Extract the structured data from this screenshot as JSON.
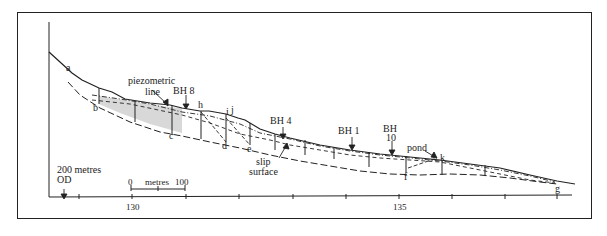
{
  "figure": {
    "type": "geological cross-section of landslide slope",
    "point_labels": [
      "a",
      "b",
      "c",
      "d",
      "e",
      "f",
      "g",
      "h",
      "i",
      "j",
      "k"
    ],
    "annotations": {
      "piezometric": [
        "piezometric",
        "line"
      ],
      "bh8": "BH 8",
      "bh4": "BH 4",
      "bh1": "BH 1",
      "bh10": [
        "BH",
        "10"
      ],
      "pond": "pond",
      "slip": [
        "slip",
        "surface"
      ],
      "datum": [
        "200 metres",
        "OD"
      ]
    },
    "scale_bar": {
      "start": "0",
      "unit": "metres",
      "end": "100"
    },
    "axis": {
      "ticks": [
        "130",
        "135"
      ]
    },
    "colors": {
      "line": "#222222",
      "shading": "#d8d8d8",
      "background": "#ffffff"
    }
  },
  "labels": {
    "a": "a",
    "b": "b",
    "c": "c",
    "d": "d",
    "e": "e",
    "f": "f",
    "g": "g",
    "h": "h",
    "i": "i",
    "j": "j",
    "k": "k"
  }
}
